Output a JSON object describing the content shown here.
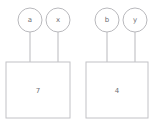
{
  "diagram": {
    "background_color": "#ffffff",
    "stroke_color": "#b9b9bd",
    "text_color": "#6e6e73",
    "groups": [
      {
        "name": "left-group",
        "box": {
          "label": "7",
          "x": 6,
          "y": 62,
          "width": 64,
          "height": 56
        },
        "nodes": [
          {
            "label": "a",
            "cx": 30,
            "cy": 20,
            "r": 12,
            "edge_x": 30,
            "edge_y1": 32,
            "edge_y2": 62
          },
          {
            "label": "x",
            "cx": 58,
            "cy": 20,
            "r": 12,
            "edge_x": 58,
            "edge_y1": 32,
            "edge_y2": 62
          }
        ]
      },
      {
        "name": "right-group",
        "box": {
          "label": "4",
          "x": 86,
          "y": 62,
          "width": 62,
          "height": 56
        },
        "nodes": [
          {
            "label": "b",
            "cx": 107,
            "cy": 20,
            "r": 12,
            "edge_x": 107,
            "edge_y1": 32,
            "edge_y2": 62
          },
          {
            "label": "y",
            "cx": 135,
            "cy": 20,
            "r": 12,
            "edge_x": 135,
            "edge_y1": 32,
            "edge_y2": 62
          }
        ]
      }
    ]
  }
}
